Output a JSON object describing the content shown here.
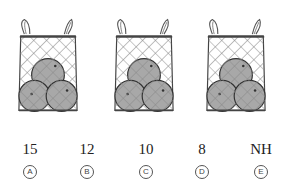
{
  "figure": {
    "bags": [
      {
        "label": "net bag 1",
        "items": 3,
        "item_type": "orange"
      },
      {
        "label": "net bag 2",
        "items": 3,
        "item_type": "orange"
      },
      {
        "label": "net bag 3",
        "items": 3,
        "item_type": "orange"
      }
    ],
    "colors": {
      "orange_fill": "#a8a8a8",
      "outline": "#333333",
      "net": "#8a8a8a"
    }
  },
  "choices": [
    {
      "letter": "A",
      "value": "15"
    },
    {
      "letter": "B",
      "value": "12"
    },
    {
      "letter": "C",
      "value": "10"
    },
    {
      "letter": "D",
      "value": "8"
    },
    {
      "letter": "E",
      "value": "NH"
    }
  ]
}
